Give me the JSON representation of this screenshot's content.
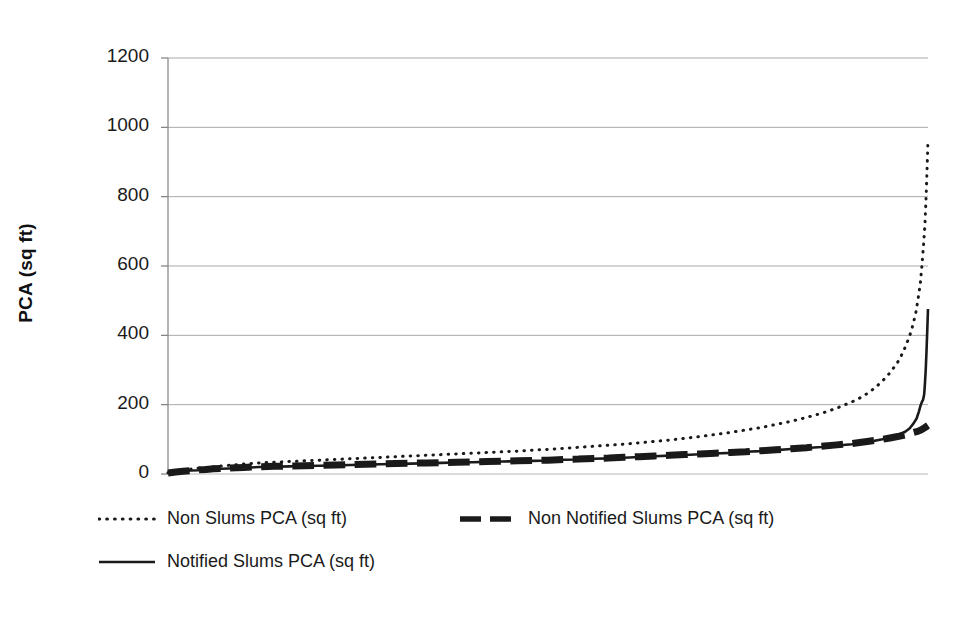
{
  "chart_data": {
    "type": "line",
    "title": "",
    "subtitle": "",
    "xlabel": "",
    "ylabel": "PCA (sq ft)",
    "xlim": [
      0,
      100
    ],
    "ylim": [
      0,
      1200
    ],
    "grid": "horizontal",
    "x_axis_visible": false,
    "x_tick_labels": [],
    "y_tick_labels": [
      "0",
      "200",
      "400",
      "600",
      "800",
      "1000",
      "1200"
    ],
    "y_ticks": [
      0,
      200,
      400,
      600,
      800,
      1000,
      1200
    ],
    "legend_position": "bottom",
    "series": [
      {
        "name": "Non Slums PCA (sq ft)",
        "style": "dotted",
        "color": "#1a1a1a",
        "width": 3,
        "x": [
          0,
          1,
          2,
          3,
          4,
          5,
          6,
          7,
          8,
          9,
          10,
          12,
          14,
          16,
          18,
          20,
          22,
          24,
          26,
          28,
          30,
          32,
          34,
          36,
          38,
          40,
          42,
          44,
          46,
          48,
          50,
          52,
          54,
          56,
          58,
          60,
          62,
          64,
          66,
          68,
          70,
          72,
          74,
          76,
          78,
          80,
          82,
          84,
          86,
          88,
          90,
          91,
          92,
          93,
          94,
          95,
          96,
          96.5,
          97,
          97.4,
          97.8,
          98.1,
          98.4,
          98.6,
          98.8,
          99,
          99.15,
          99.3,
          99.45,
          99.6,
          99.7,
          99.8,
          99.9,
          100
        ],
        "values": [
          4,
          8,
          11,
          14,
          17,
          19,
          21,
          23,
          25,
          27,
          29,
          32,
          34,
          36,
          38,
          40,
          42,
          44,
          46,
          48,
          50,
          52,
          54,
          56,
          58,
          60,
          62,
          64,
          66,
          69,
          71,
          74,
          77,
          80,
          83,
          86,
          90,
          94,
          98,
          103,
          108,
          114,
          120,
          127,
          134,
          143,
          152,
          163,
          175,
          190,
          208,
          219,
          232,
          248,
          268,
          292,
          322,
          342,
          366,
          388,
          412,
          438,
          465,
          492,
          520,
          552,
          588,
          628,
          672,
          720,
          772,
          828,
          895,
          963
        ]
      },
      {
        "name": "Non Notified Slums PCA (sq ft)",
        "style": "dashed",
        "color": "#1a1a1a",
        "width": 7,
        "x": [
          0,
          1,
          2,
          3,
          4,
          5,
          6,
          7,
          8,
          9,
          10,
          12,
          14,
          16,
          18,
          20,
          22,
          24,
          26,
          28,
          30,
          32,
          34,
          36,
          38,
          40,
          42,
          44,
          46,
          48,
          50,
          52,
          54,
          56,
          58,
          60,
          62,
          64,
          66,
          68,
          70,
          72,
          74,
          76,
          78,
          80,
          82,
          84,
          86,
          88,
          90,
          91,
          92,
          93,
          94,
          95,
          96,
          97,
          98,
          98.5,
          99,
          99.3,
          99.6,
          99.8,
          100
        ],
        "values": [
          3,
          6,
          8,
          10,
          12,
          13,
          15,
          16,
          17,
          18,
          19,
          21,
          22,
          23,
          24,
          25,
          26,
          27,
          28,
          29,
          30,
          31,
          32,
          33,
          34,
          35,
          36,
          37,
          38,
          39,
          40,
          42,
          43,
          45,
          46,
          48,
          50,
          52,
          54,
          56,
          58,
          60,
          62,
          64,
          67,
          70,
          73,
          76,
          80,
          84,
          88,
          91,
          94,
          97,
          100,
          104,
          108,
          113,
          119,
          122,
          126,
          130,
          134,
          137,
          140
        ]
      },
      {
        "name": "Notified Slums PCA (sq ft)",
        "style": "solid",
        "color": "#1a1a1a",
        "width": 2.6,
        "x": [
          0,
          1,
          2,
          3,
          4,
          5,
          6,
          7,
          8,
          9,
          10,
          12,
          14,
          16,
          18,
          20,
          22,
          24,
          26,
          28,
          30,
          32,
          34,
          36,
          38,
          40,
          42,
          44,
          46,
          48,
          50,
          52,
          54,
          56,
          58,
          60,
          62,
          64,
          66,
          68,
          70,
          72,
          74,
          76,
          78,
          80,
          82,
          84,
          86,
          88,
          90,
          91,
          92,
          93,
          94,
          95,
          96,
          97,
          97.6,
          98.1,
          98.5,
          98.8,
          99,
          99.2,
          99.35,
          99.5,
          99.6,
          99.7,
          99.8,
          99.9,
          100
        ],
        "values": [
          3,
          6,
          8,
          10,
          11,
          13,
          14,
          15,
          16,
          17,
          18,
          20,
          21,
          22,
          23,
          24,
          25,
          26,
          27,
          28,
          29,
          30,
          31,
          32,
          33,
          34,
          35,
          36,
          37,
          38,
          39,
          41,
          42,
          44,
          45,
          47,
          49,
          51,
          53,
          55,
          57,
          59,
          61,
          64,
          66,
          69,
          72,
          75,
          78,
          82,
          86,
          89,
          92,
          96,
          100,
          105,
          112,
          122,
          132,
          146,
          160,
          180,
          196,
          208,
          214,
          230,
          262,
          300,
          352,
          412,
          476
        ]
      }
    ],
    "annotations": []
  },
  "legend": {
    "items": [
      {
        "label": "Non Slums PCA (sq ft)",
        "key": "dotted-line-key"
      },
      {
        "label": "Non Notified Slums PCA (sq ft)",
        "key": "dashed-line-key"
      },
      {
        "label": "Notified Slums PCA (sq ft)",
        "key": "solid-line-key"
      }
    ]
  }
}
